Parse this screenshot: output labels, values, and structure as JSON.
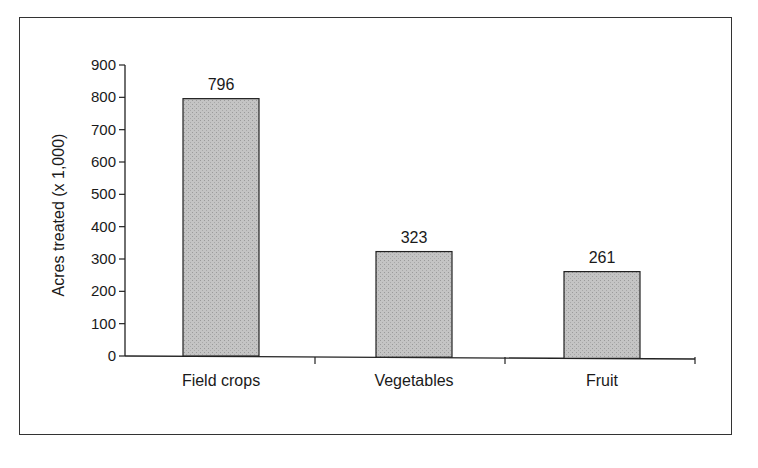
{
  "chart_data": {
    "type": "bar",
    "title": "",
    "xlabel": "",
    "ylabel": "Acres treated (x 1,000)",
    "categories": [
      "Field crops",
      "Vegetables",
      "Fruit"
    ],
    "values": [
      796,
      323,
      261
    ],
    "data_labels": [
      "796",
      "323",
      "261"
    ],
    "ylim": [
      0,
      900
    ],
    "yticks": [
      0,
      100,
      200,
      300,
      400,
      500,
      600,
      700,
      800,
      900
    ],
    "grid": false,
    "legend": null,
    "bar_color": "#bdbdbd",
    "bar_edge_color": "#222222"
  }
}
